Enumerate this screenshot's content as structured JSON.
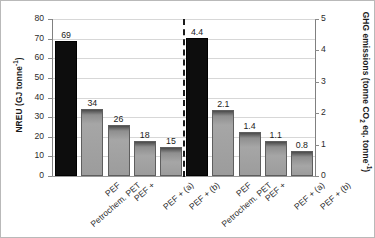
{
  "chart_data": {
    "type": "bar",
    "title": "",
    "grid": true,
    "legend": "none",
    "groups": [
      {
        "name": "NREU",
        "axis": "left",
        "categories": [
          "Petrochem. PET",
          "PEF",
          "PEF +",
          "PEF + (a)",
          "PEF + (b)"
        ],
        "values": [
          69,
          34,
          26,
          18,
          15
        ],
        "labels": [
          "69",
          "34",
          "26",
          "18",
          "15"
        ],
        "colors": [
          "black",
          "gray",
          "gray",
          "gray",
          "gray"
        ]
      },
      {
        "name": "GHG emissions",
        "axis": "right",
        "categories": [
          "Petrochem. PET",
          "PEF",
          "PEF +",
          "PEF + (a)",
          "PEF + (b)"
        ],
        "values": [
          4.4,
          2.1,
          1.4,
          1.1,
          0.8
        ],
        "labels": [
          "4.4",
          "2.1",
          "1.4",
          "1.1",
          "0.8"
        ],
        "colors": [
          "black",
          "gray",
          "gray",
          "gray",
          "gray"
        ]
      }
    ],
    "left_axis": {
      "label_prefix": "NREU (GJ tonne",
      "label_sup": "-1",
      "label_suffix": ")",
      "ylim": [
        0,
        80
      ],
      "ticks": [
        0,
        10,
        20,
        30,
        40,
        50,
        60,
        70,
        80
      ],
      "ticklabels": [
        "0",
        "10",
        "20",
        "30",
        "40",
        "50",
        "60",
        "70",
        "80"
      ]
    },
    "right_axis": {
      "label_part1": "GHG emissions (tonne CO",
      "label_sub": "2",
      "label_part2": " eq. tonne",
      "label_sup": "-1",
      "label_part3": ")",
      "ylim": [
        0,
        5
      ],
      "ticks": [
        0,
        1,
        2,
        3,
        4,
        5
      ],
      "ticklabels": [
        "0",
        "1",
        "2",
        "3",
        "4",
        "5"
      ]
    },
    "divider": {
      "style": "dashed",
      "orientation": "vertical"
    }
  }
}
